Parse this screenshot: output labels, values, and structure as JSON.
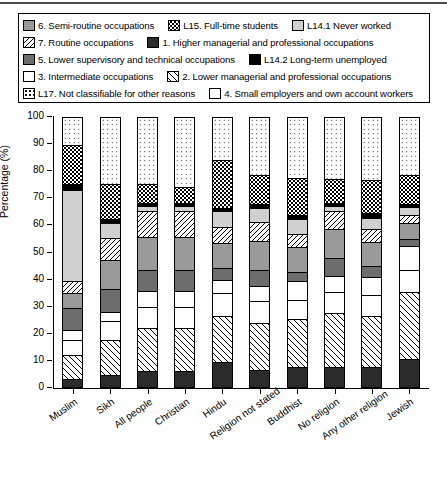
{
  "chart_data": {
    "type": "bar",
    "subtype": "stacked-percentage",
    "title": "",
    "xlabel": "",
    "ylabel": "Percentage (%)",
    "ylim": [
      0,
      100
    ],
    "ytick_labels": [
      "0",
      "10",
      "20",
      "30",
      "40",
      "50",
      "60",
      "70",
      "80",
      "90",
      "100"
    ],
    "grid": false,
    "legend_position": "top",
    "categories": [
      "Muslim",
      "Sikh",
      "All people",
      "Christian",
      "Hindu",
      "Religion not stated",
      "Buddhist",
      "No religion",
      "Any other religion",
      "Jewish"
    ],
    "series": [
      {
        "name": "1. Higher managerial and professional occupations",
        "key": "higher",
        "values": [
          2.5,
          4.0,
          5.5,
          5.5,
          9.0,
          6.0,
          7.0,
          7.0,
          7.0,
          10.0
        ]
      },
      {
        "name": "2. Lower managerial and professional occupations",
        "key": "lowermgr",
        "values": [
          9.0,
          13.0,
          16.0,
          16.0,
          17.0,
          17.5,
          18.0,
          20.0,
          19.0,
          25.0
        ]
      },
      {
        "name": "3. Intermediate occupations",
        "key": "intermediate",
        "values": [
          5.5,
          7.0,
          8.0,
          8.0,
          8.5,
          8.0,
          7.0,
          8.0,
          8.0,
          8.0
        ]
      },
      {
        "name": "4. Small employers and own account workers",
        "key": "smallemp",
        "values": [
          4.0,
          3.5,
          6.0,
          6.0,
          5.0,
          5.5,
          7.0,
          6.0,
          6.5,
          9.0
        ]
      },
      {
        "name": "5. Lower supervisory and technical occupations",
        "key": "lowersup",
        "values": [
          8.0,
          8.5,
          7.5,
          7.5,
          4.5,
          6.0,
          3.5,
          6.5,
          4.0,
          2.5
        ]
      },
      {
        "name": "6. Semi-routine occupations",
        "key": "semiroutine",
        "values": [
          5.5,
          11.0,
          12.5,
          12.5,
          9.0,
          11.0,
          9.0,
          11.0,
          9.0,
          6.0
        ]
      },
      {
        "name": "7. Routine occupations",
        "key": "routine",
        "values": [
          4.5,
          8.0,
          9.5,
          9.5,
          6.0,
          7.0,
          5.0,
          6.5,
          5.0,
          3.0
        ]
      },
      {
        "name": "L14.1 Never worked",
        "key": "neverworked",
        "values": [
          34.0,
          5.5,
          2.0,
          2.0,
          6.0,
          5.0,
          5.5,
          2.0,
          4.0,
          3.0
        ]
      },
      {
        "name": "L14.2 Long-term unemployed",
        "key": "longterm",
        "values": [
          2.0,
          1.5,
          1.0,
          1.0,
          1.0,
          1.5,
          1.5,
          1.0,
          2.0,
          1.0
        ]
      },
      {
        "name": "L15. Full-time students",
        "key": "students",
        "values": [
          14.5,
          13.0,
          7.0,
          6.0,
          18.0,
          11.0,
          14.0,
          9.0,
          12.0,
          11.0
        ]
      },
      {
        "name": "L17. Not classifiable for other reasons",
        "key": "notclass",
        "values": [
          10.5,
          25.0,
          25.0,
          26.0,
          16.0,
          21.5,
          22.5,
          23.0,
          23.5,
          21.5
        ]
      }
    ]
  },
  "legend": {
    "rows": [
      [
        {
          "swatch": "sw-semiroutine",
          "name": "semiroutine-swatch",
          "label": "6. Semi-routine occupations"
        },
        {
          "swatch": "sw-students",
          "name": "students-swatch",
          "label": "L15. Full-time students"
        },
        {
          "swatch": "sw-neverworked",
          "name": "neverworked-swatch",
          "label": "L14.1 Never worked"
        }
      ],
      [
        {
          "swatch": "sw-routine",
          "name": "routine-swatch",
          "label": "7. Routine occupations"
        },
        {
          "swatch": "sw-higher",
          "name": "higher-swatch",
          "label": "1. Higher managerial and professional occupations"
        }
      ],
      [
        {
          "swatch": "sw-lowersup",
          "name": "lowersup-swatch",
          "label": "5. Lower supervisory and technical occupations"
        },
        {
          "swatch": "sw-longterm",
          "name": "longterm-swatch",
          "label": "L14.2 Long-term unemployed"
        }
      ],
      [
        {
          "swatch": "sw-intermediate",
          "name": "intermediate-swatch",
          "label": "3. Intermediate occupations"
        },
        {
          "swatch": "sw-lowermgr",
          "name": "lowermgr-swatch",
          "label": "2. Lower managerial and professional occupations"
        }
      ],
      [
        {
          "swatch": "sw-notclass",
          "name": "notclass-swatch",
          "label": "L17. Not classifiable for other reasons"
        },
        {
          "swatch": "sw-smallemp",
          "name": "smallemp-swatch",
          "label": "4. Small employers and own account workers"
        }
      ]
    ]
  },
  "colors": {
    "higher": "#2b2b2b",
    "lowersup": "#6d6d6d",
    "semiroutine": "#9a9a9a",
    "neverworked": "#d0d0d0",
    "longterm": "#000000",
    "background": "#ffffff",
    "axis": "#000000"
  }
}
